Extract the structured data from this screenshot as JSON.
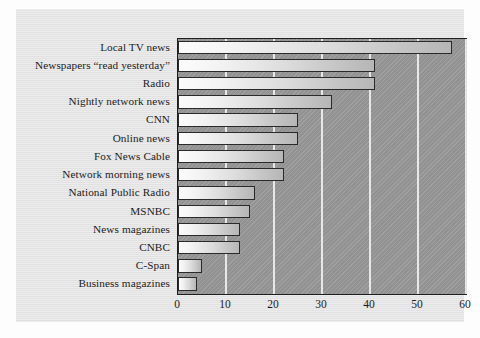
{
  "chart_data": {
    "type": "bar",
    "orientation": "horizontal",
    "title": "",
    "subtitle": "",
    "xlabel": "",
    "ylabel": "",
    "xlim": [
      0,
      60
    ],
    "xticks": [
      0,
      10,
      20,
      30,
      40,
      50,
      60
    ],
    "grid": true,
    "legend": null,
    "categories": [
      "Local TV news",
      "Newspapers “read yesterday”",
      "Radio",
      "Nightly network news",
      "CNN",
      "Online news",
      "Fox News Cable",
      "Network morning news",
      "National Public Radio",
      "MSNBC",
      "News magazines",
      "CNBC",
      "C-Span",
      "Business magazines"
    ],
    "values": [
      57,
      41,
      41,
      32,
      25,
      25,
      22,
      22,
      16,
      15,
      13,
      13,
      5,
      4
    ],
    "series": [
      {
        "name": "Percent",
        "values": [
          57,
          41,
          41,
          32,
          25,
          25,
          22,
          22,
          16,
          15,
          13,
          13,
          5,
          4
        ]
      }
    ]
  },
  "colors": {
    "figure_background": "#fdfdfd",
    "panel_background": "#e4e4e4",
    "plot_background": "#9a9a9a",
    "bar_fill_light": "#fcfcfc",
    "bar_fill_dark": "#b6b6b6",
    "bar_outline": "#2a2a2a",
    "gridline": "#efefef",
    "text": "#1b1b1b"
  }
}
